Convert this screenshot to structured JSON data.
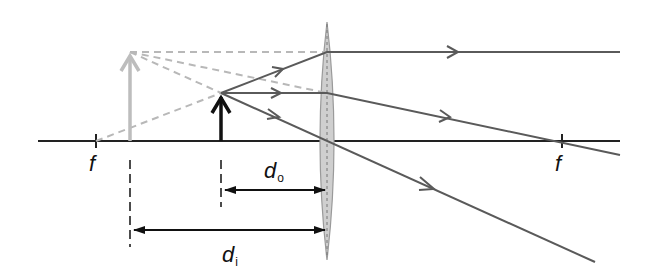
{
  "diagram": {
    "type": "optics-ray-diagram",
    "labels": {
      "focal_left": "f",
      "focal_right": "f",
      "object_distance": "d",
      "object_distance_sub": "o",
      "image_distance": "d",
      "image_distance_sub": "i"
    },
    "colors": {
      "axis": "#222222",
      "ray": "#555555",
      "virtual_ray": "#b5b5b5",
      "object_arrow": "#111111",
      "image_arrow": "#bdbdbd",
      "lens_fill": "#cfcfcf",
      "lens_stroke": "#9a9a9a",
      "dimension": "#111111"
    },
    "geometry": {
      "axis_y": 141,
      "lens_x": 327,
      "focal_left_x": 96,
      "focal_right_x": 562,
      "object_x": 221,
      "object_top_y": 93,
      "image_x": 130,
      "image_top_y": 52
    }
  }
}
